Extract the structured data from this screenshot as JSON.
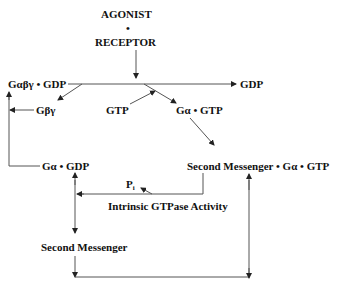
{
  "diagram": {
    "agonist": "AGONIST",
    "dot": "•",
    "receptor": "RECEPTOR",
    "g_abg_gdp": "Gαβγ • GDP",
    "gdp_released": "GDP",
    "g_bg": "Gβγ",
    "gtp": "GTP",
    "ga_gtp": "Gα • GTP",
    "ga_gdp": "Gα • GDP",
    "sm_ga_gtp": "Second Messenger • Gα • GTP",
    "pi_main": "P",
    "pi_sub": "i",
    "gtpase": "Intrinsic GTPase Activity",
    "second_messenger": "Second Messenger"
  },
  "colors": {
    "line": "#555555",
    "text": "#111111",
    "background": "#ffffff"
  }
}
